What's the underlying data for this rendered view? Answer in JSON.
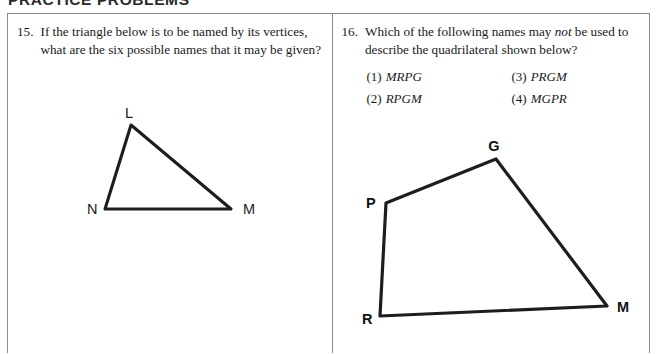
{
  "page": {
    "heading": "PRACTICE PROBLEMS"
  },
  "problems": [
    {
      "number": "15.",
      "text_before_italic": "If the triangle below is to be named by its vertices, what are the six possible names that it may be given?",
      "italic_word": "",
      "text_after_italic": "",
      "figure": {
        "type": "triangle",
        "vertices": [
          {
            "label": "L",
            "x": 130,
            "y": 118
          },
          {
            "label": "M",
            "x": 230,
            "y": 202
          },
          {
            "label": "N",
            "x": 104,
            "y": 202
          }
        ],
        "labels": [
          {
            "label": "L",
            "x": 128,
            "y": 110
          },
          {
            "label": "M",
            "x": 242,
            "y": 206
          },
          {
            "label": "N",
            "x": 86,
            "y": 206
          }
        ]
      }
    },
    {
      "number": "16.",
      "text_before_italic": "Which of the following names may ",
      "italic_word": "not",
      "text_after_italic": " be used to describe the quadrilateral shown below?",
      "choices": [
        {
          "key": "(1)",
          "value": "MRPG"
        },
        {
          "key": "(3)",
          "value": "PRGM"
        },
        {
          "key": "(2)",
          "value": "RPGM"
        },
        {
          "key": "(4)",
          "value": "MGPR"
        }
      ],
      "figure": {
        "type": "quadrilateral",
        "vertices": [
          {
            "label": "R",
            "x": 381,
            "y": 316
          },
          {
            "label": "P",
            "x": 387,
            "y": 203
          },
          {
            "label": "G",
            "x": 497,
            "y": 159
          },
          {
            "label": "M",
            "x": 608,
            "y": 306
          }
        ],
        "labels": [
          {
            "label": "R",
            "x": 365,
            "y": 322
          },
          {
            "label": "P",
            "x": 371,
            "y": 203
          },
          {
            "label": "G",
            "x": 494,
            "y": 152
          },
          {
            "label": "M",
            "x": 618,
            "y": 310
          }
        ]
      }
    }
  ],
  "colors": {
    "border": "#8c8c8c",
    "ink": "#1a1a1a",
    "figure_stroke": "#1d1d1d",
    "background": "#ffffff"
  }
}
